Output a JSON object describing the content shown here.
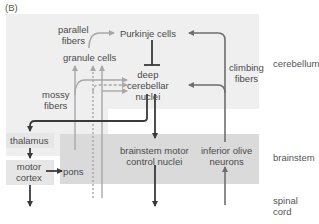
{
  "panel_label": "(B)",
  "regions": {
    "cerebellum": "cerebellum",
    "brainstem": "brainstem",
    "spinal_cord_line1": "spinal",
    "spinal_cord_line2": "cord"
  },
  "nodes": {
    "purkinje": "Purkinje cells",
    "parallel_line1": "parallel",
    "parallel_line2": "fibers",
    "granule": "granule cells",
    "deep_line1": "deep",
    "deep_line2": "cerebellar",
    "deep_line3": "nuclei",
    "mossy_line1": "mossy",
    "mossy_line2": "fibers",
    "climbing_line1": "climbing",
    "climbing_line2": "fibers",
    "thalamus": "thalamus",
    "motor_cortex_line1": "motor",
    "motor_cortex_line2": "cortex",
    "pons": "pons",
    "brainstem_motor_line1": "brainstem motor",
    "brainstem_motor_line2": "control nuclei",
    "inferior_olive_line1": "inferior olive",
    "inferior_olive_line2": "neurons"
  },
  "colors": {
    "cerebellum_bg": "#efefef",
    "brainstem_bg": "#dadada",
    "box_bg": "#e6e6e6",
    "dark_arrow": "#3a3a3a",
    "light_arrow": "#a8a8a8",
    "olive_arrow": "#6e6e6e"
  }
}
